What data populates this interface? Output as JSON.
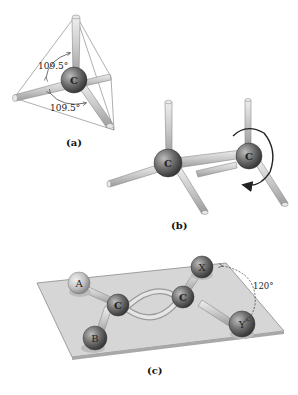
{
  "panels": {
    "a": {
      "label": "(a)",
      "atom": "C",
      "angle_top": "109.5°",
      "angle_bottom": "109.5°"
    },
    "b": {
      "label": "(b)",
      "atom_left": "C",
      "atom_right": "C"
    },
    "c": {
      "label": "(c)",
      "atom_a": "A",
      "atom_b": "B",
      "atom_c_left": "C",
      "atom_c_right": "C",
      "atom_x": "X",
      "atom_y": "Y",
      "angle": "120°"
    }
  },
  "colors": {
    "bond": "#c8c8c8",
    "atom": "#6e6e6e",
    "plane": "#d4d4d4",
    "outline": "#555555"
  }
}
